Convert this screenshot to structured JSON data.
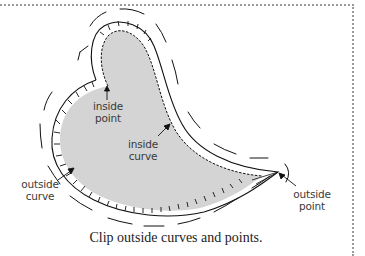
{
  "labels": {
    "inside_point": [
      "inside",
      "point"
    ],
    "inside_curve": [
      "inside",
      "curve"
    ],
    "outside_curve": [
      "outside",
      "curve"
    ],
    "outside_point": [
      "outside",
      "point"
    ]
  },
  "caption": "Clip outside curves and points.",
  "colors": {
    "fill": "#d4d4d4",
    "stroke": "#111111",
    "frame": "#9a9a9a",
    "label": "#3a3a3a"
  }
}
